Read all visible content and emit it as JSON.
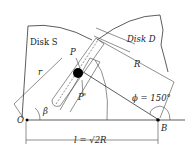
{
  "diagram": {
    "labels": {
      "disk_s": "Disk S",
      "disk_d": "Disk D",
      "pin_p_top": "P",
      "pin_p_bottom": "P'",
      "radius_r": "r",
      "radius_R": "R",
      "angle_beta": "β",
      "angle_phi": "ϕ = 150°",
      "point_O": "O",
      "point_B": "B",
      "distance_l": "l = √2R"
    },
    "geometry": {
      "phi_deg": 150,
      "l_relation": "√2R"
    },
    "colors": {
      "line": "#333333",
      "pin": "#000000",
      "background": "#ffffff"
    }
  }
}
